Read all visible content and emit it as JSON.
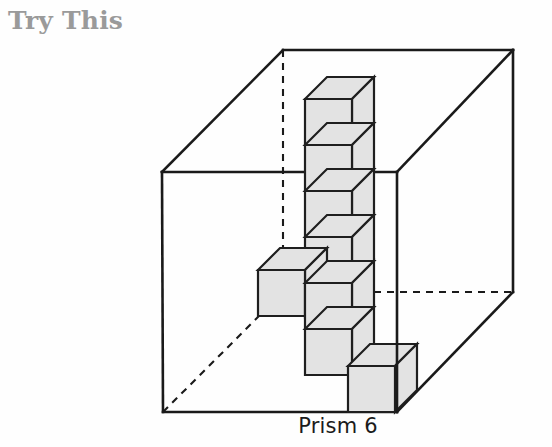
{
  "page": {
    "heading": "Try This",
    "caption": "Prism 6",
    "background_color": "#fefefe"
  },
  "figure": {
    "name": "prism-6-isometric-figure",
    "cube_fill_color": "#e3e3e3",
    "cube_stroke_color": "#1f1f1f",
    "box_stroke_color": "#1a1a1a",
    "hidden_edge_style": "dashed",
    "heading_color": "#9a9a9a",
    "caption_color": "#1b1b1b",
    "bounding_box": {
      "front_top_left": [
        162,
        172
      ],
      "front_top_right": [
        397,
        172
      ],
      "front_bottom_left": [
        163,
        412
      ],
      "front_bottom_right": [
        397,
        412
      ],
      "back_top_left": [
        283,
        50
      ],
      "back_top_right": [
        513,
        50
      ],
      "back_bottom_left": [
        283,
        292
      ],
      "back_bottom_right": [
        513,
        292
      ]
    },
    "unit_cube": {
      "width": 47,
      "height": 46,
      "depth_dx": 22,
      "depth_dy": -22
    },
    "cubes": [
      {
        "label": "column-top",
        "x": 305,
        "y": 99
      },
      {
        "label": "column-second",
        "x": 305,
        "y": 145
      },
      {
        "label": "column-third",
        "x": 305,
        "y": 191
      },
      {
        "label": "column-fourth",
        "x": 305,
        "y": 237
      },
      {
        "label": "step-left-upper",
        "x": 258,
        "y": 270
      },
      {
        "label": "column-fifth",
        "x": 305,
        "y": 283
      },
      {
        "label": "step-mid-lower",
        "x": 305,
        "y": 329
      },
      {
        "label": "step-right-lower",
        "x": 348,
        "y": 366
      }
    ],
    "cube_count": 8
  }
}
